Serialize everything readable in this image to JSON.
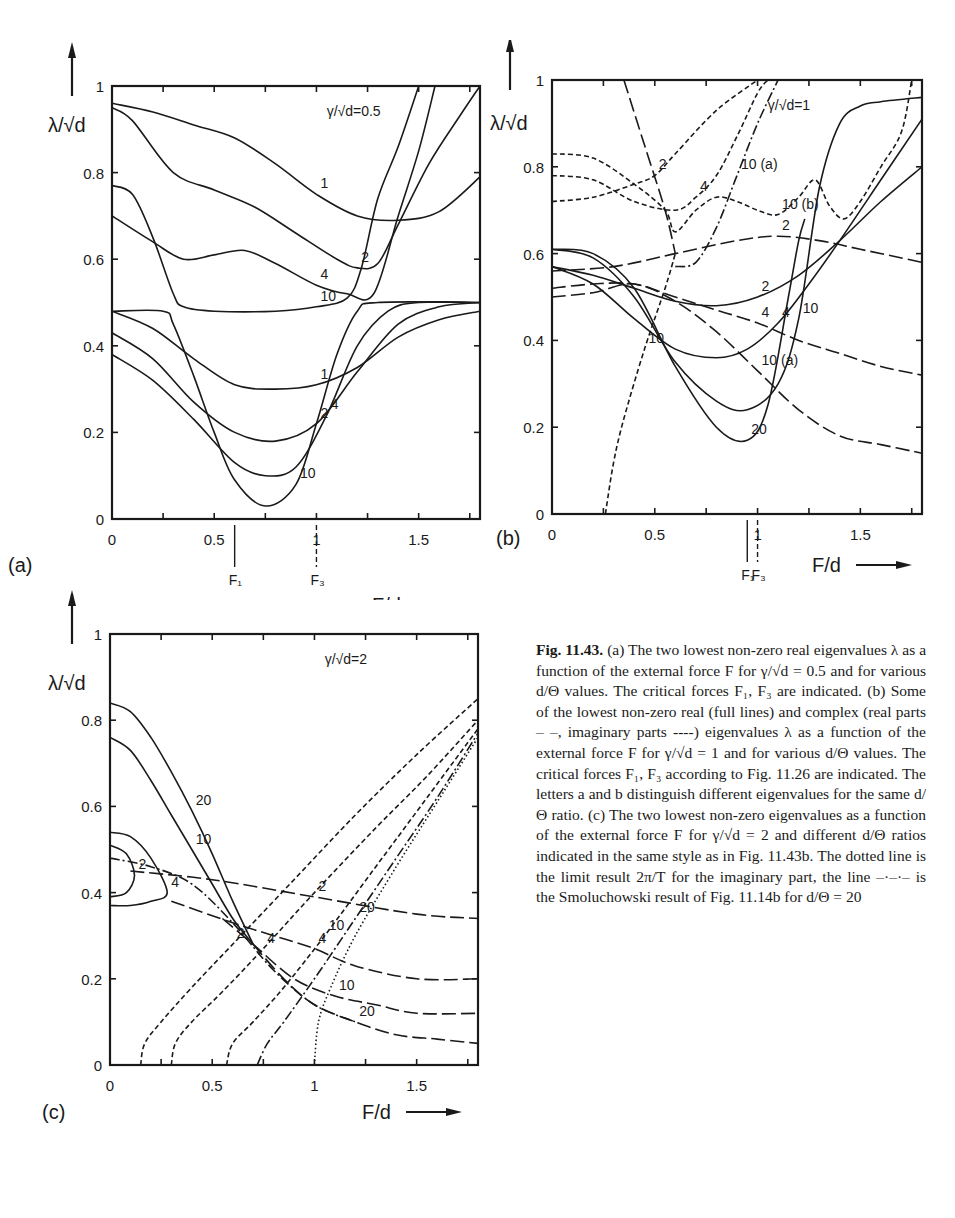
{
  "figure_caption": {
    "label": "Fig. 11.43.",
    "text_a": "(a) The two lowest non-zero real eigenvalues λ as a function of the external force F for γ/√d = 0.5 and for various d/Θ values. The critical forces F₁, F₃ are indicated.",
    "text_b": "(b) Some of the lowest non-zero real (full lines) and complex (real parts – –, imaginary parts ----) eigenvalues λ as a function of the external force F for γ/√d = 1 and for various d/Θ values. The critical forces F₁, F₃ according to Fig. 11.26 are indicated. The letters a and b distinguish different eigenvalues for the same d/Θ ratio.",
    "text_c": "(c) The two lowest non-zero eigenvalues as a function of the external force F for γ/√d = 2 and different d/Θ ratios indicated in the same style as in Fig. 11.43b. The dotted line is the limit result 2π/T for the imaginary part, the line –·–·– is the Smoluchowski result of Fig. 11.14b for d/Θ = 20"
  },
  "chart_data": [
    {
      "type": "line",
      "panel": "(a)",
      "title": "γ/√d=0.5",
      "xlabel": "F/d",
      "ylabel": "λ/√d",
      "xlim": [
        0,
        1.8
      ],
      "ylim": [
        0,
        1
      ],
      "xticks": [
        "0",
        "0.5",
        "1",
        "1.5"
      ],
      "yticks": [
        "0",
        "0.2",
        "0.4",
        "0.6",
        "0.8",
        "1"
      ],
      "markers": [
        {
          "label": "F₁",
          "x": 0.6
        },
        {
          "label": "F₃",
          "x": 1.0
        }
      ],
      "series": [
        {
          "name": "1 (upper)",
          "style": "solid",
          "label": "1",
          "x": [
            0,
            0.2,
            0.4,
            0.6,
            0.8,
            1.0,
            1.2,
            1.4,
            1.6,
            1.8
          ],
          "y": [
            0.96,
            0.94,
            0.91,
            0.88,
            0.82,
            0.75,
            0.7,
            0.69,
            0.71,
            0.79
          ]
        },
        {
          "name": "2 (upper)",
          "style": "solid",
          "label": "2",
          "x": [
            0,
            0.1,
            0.3,
            0.5,
            0.7,
            0.9,
            1.1,
            1.2,
            1.3,
            1.4,
            1.55,
            1.7,
            1.8
          ],
          "y": [
            0.95,
            0.92,
            0.8,
            0.76,
            0.72,
            0.66,
            0.6,
            0.58,
            0.59,
            0.68,
            0.82,
            0.93,
            1.0
          ]
        },
        {
          "name": "4 (upper)",
          "style": "solid",
          "label": "4",
          "x": [
            0,
            0.2,
            0.35,
            0.5,
            0.65,
            0.8,
            1.0,
            1.15,
            1.28,
            1.4,
            1.5,
            1.58
          ],
          "y": [
            0.7,
            0.64,
            0.6,
            0.61,
            0.62,
            0.59,
            0.54,
            0.52,
            0.52,
            0.7,
            0.85,
            1.0
          ]
        },
        {
          "name": "10 (upper)",
          "style": "solid",
          "label": "10",
          "x": [
            0,
            0.1,
            0.2,
            0.3,
            0.35,
            0.5,
            0.8,
            1.0,
            1.15,
            1.22,
            1.3,
            1.4,
            1.5
          ],
          "y": [
            0.77,
            0.75,
            0.65,
            0.52,
            0.49,
            0.48,
            0.48,
            0.49,
            0.51,
            0.58,
            0.74,
            0.86,
            1.0
          ]
        },
        {
          "name": "1 (lower)",
          "style": "solid",
          "label": "1",
          "x": [
            0,
            0.2,
            0.4,
            0.6,
            0.8,
            1.0,
            1.2,
            1.4,
            1.6,
            1.8
          ],
          "y": [
            0.48,
            0.44,
            0.37,
            0.31,
            0.3,
            0.31,
            0.35,
            0.42,
            0.46,
            0.48
          ]
        },
        {
          "name": "2 (lower)",
          "style": "solid",
          "label": "2",
          "x": [
            0,
            0.2,
            0.4,
            0.6,
            0.8,
            1.0,
            1.2,
            1.4,
            1.6,
            1.8
          ],
          "y": [
            0.43,
            0.37,
            0.27,
            0.2,
            0.18,
            0.22,
            0.34,
            0.45,
            0.49,
            0.5
          ]
        },
        {
          "name": "4 (lower)",
          "style": "solid",
          "label": "4",
          "x": [
            0,
            0.2,
            0.4,
            0.6,
            0.75,
            0.9,
            1.05,
            1.2,
            1.35,
            1.5,
            1.8
          ],
          "y": [
            0.38,
            0.32,
            0.23,
            0.13,
            0.1,
            0.12,
            0.24,
            0.4,
            0.48,
            0.5,
            0.5
          ]
        },
        {
          "name": "10 (lower)",
          "style": "solid",
          "label": "10",
          "x": [
            0,
            0.25,
            0.3,
            0.4,
            0.5,
            0.6,
            0.75,
            0.9,
            1.0,
            1.1,
            1.2,
            1.3,
            1.8
          ],
          "y": [
            0.48,
            0.48,
            0.45,
            0.33,
            0.2,
            0.09,
            0.03,
            0.08,
            0.22,
            0.38,
            0.48,
            0.5,
            0.5
          ]
        }
      ]
    },
    {
      "type": "line",
      "panel": "(b)",
      "title": "γ/√d=1",
      "xlabel": "F/d",
      "ylabel": "λ/√d",
      "xlim": [
        0,
        1.8
      ],
      "ylim": [
        0,
        1
      ],
      "xticks": [
        "0",
        "0.5",
        "1",
        "1.5"
      ],
      "yticks": [
        "0",
        "0.2",
        "0.4",
        "0.6",
        "0.8",
        "1"
      ],
      "markers": [
        {
          "label": "F₁",
          "x": 0.95
        },
        {
          "label": "F₃",
          "x": 1.0
        }
      ],
      "series": [
        {
          "name": "2 real",
          "style": "solid",
          "label": "2",
          "x": [
            0,
            0.2,
            0.4,
            0.6,
            0.8,
            1.0,
            1.2,
            1.4,
            1.6,
            1.8
          ],
          "y": [
            0.57,
            0.55,
            0.52,
            0.49,
            0.48,
            0.5,
            0.55,
            0.63,
            0.72,
            0.8
          ]
        },
        {
          "name": "4 real",
          "style": "solid",
          "label": "4",
          "x": [
            0,
            0.2,
            0.4,
            0.6,
            0.8,
            0.95,
            1.1,
            1.25,
            1.4,
            1.6,
            1.8
          ],
          "y": [
            0.57,
            0.53,
            0.45,
            0.38,
            0.36,
            0.38,
            0.44,
            0.53,
            0.63,
            0.77,
            0.91
          ]
        },
        {
          "name": "10 real",
          "style": "solid",
          "label": "10",
          "x": [
            0,
            0.2,
            0.4,
            0.6,
            0.8,
            0.95,
            1.1,
            1.2,
            1.3,
            1.4,
            1.5,
            1.6,
            1.8
          ],
          "y": [
            0.61,
            0.59,
            0.5,
            0.35,
            0.26,
            0.24,
            0.3,
            0.45,
            0.75,
            0.9,
            0.94,
            0.95,
            0.96
          ]
        },
        {
          "name": "20 real",
          "style": "solid",
          "label": "20",
          "x": [
            0,
            0.2,
            0.4,
            0.6,
            0.8,
            0.95,
            1.05,
            1.15,
            1.2,
            1.23
          ],
          "y": [
            0.61,
            0.6,
            0.52,
            0.34,
            0.2,
            0.17,
            0.25,
            0.5,
            0.63,
            0.68
          ]
        },
        {
          "name": "2 real part",
          "style": "dashed",
          "label": "2",
          "x": [
            0,
            0.3,
            0.6,
            0.9,
            1.1,
            1.3,
            1.5,
            1.8
          ],
          "y": [
            0.56,
            0.57,
            0.6,
            0.63,
            0.64,
            0.63,
            0.61,
            0.58
          ]
        },
        {
          "name": "4 real part",
          "style": "dashed",
          "label": "4",
          "x": [
            0,
            0.2,
            0.4,
            0.6,
            0.8,
            1.0,
            1.2,
            1.4,
            1.6,
            1.8
          ],
          "y": [
            0.52,
            0.53,
            0.53,
            0.5,
            0.47,
            0.44,
            0.4,
            0.37,
            0.34,
            0.32
          ]
        },
        {
          "name": "10 real part (a)",
          "style": "dashed",
          "label": "10 (a)",
          "x": [
            0,
            0.2,
            0.4,
            0.6,
            0.8,
            1.0,
            1.2,
            1.4,
            1.6,
            1.8
          ],
          "y": [
            0.5,
            0.51,
            0.53,
            0.49,
            0.42,
            0.33,
            0.24,
            0.18,
            0.16,
            0.14
          ]
        },
        {
          "name": "10 real part (steep)",
          "style": "dashed",
          "label": "",
          "x": [
            0.35,
            0.45,
            0.55,
            0.6
          ],
          "y": [
            1.0,
            0.85,
            0.7,
            0.6
          ]
        },
        {
          "name": "2 imaginary part",
          "style": "short-dashed",
          "label": "2",
          "x": [
            0,
            0.2,
            0.4,
            0.5,
            0.6,
            0.8,
            1.0
          ],
          "y": [
            0.72,
            0.73,
            0.76,
            0.78,
            0.83,
            0.93,
            1.0
          ]
        },
        {
          "name": "4 imaginary part",
          "style": "short-dashed",
          "label": "4",
          "x": [
            0,
            0.2,
            0.4,
            0.6,
            0.7,
            0.8,
            0.9,
            1.0,
            1.05
          ],
          "y": [
            0.78,
            0.77,
            0.72,
            0.7,
            0.73,
            0.78,
            0.87,
            0.97,
            1.0
          ]
        },
        {
          "name": "10 imaginary part (b)",
          "style": "short-dashed",
          "label": "10 (b)",
          "x": [
            0,
            0.2,
            0.4,
            0.55,
            0.6,
            0.7,
            0.8,
            0.9,
            1.0,
            1.1,
            1.2,
            1.28,
            1.35,
            1.42,
            1.5,
            1.6,
            1.7,
            1.75
          ],
          "y": [
            0.83,
            0.82,
            0.76,
            0.7,
            0.65,
            0.7,
            0.73,
            0.72,
            0.7,
            0.69,
            0.73,
            0.77,
            0.71,
            0.68,
            0.72,
            0.8,
            0.88,
            1.0
          ]
        },
        {
          "name": "10 imaginary part (a)",
          "style": "dash-dot",
          "label": "10 (a)",
          "x": [
            0.6,
            0.7,
            0.8,
            0.9,
            1.0,
            1.1
          ],
          "y": [
            0.57,
            0.58,
            0.66,
            0.78,
            0.9,
            1.0
          ]
        },
        {
          "name": "10 imaginary part (rising)",
          "style": "short-dashed",
          "label": "10",
          "x": [
            0.26,
            0.3,
            0.35,
            0.45,
            0.55,
            0.6
          ],
          "y": [
            0.0,
            0.12,
            0.22,
            0.38,
            0.52,
            0.6
          ]
        }
      ]
    },
    {
      "type": "line",
      "panel": "(c)",
      "title": "γ/√d=2",
      "xlabel": "F/d",
      "ylabel": "λ/√d",
      "xlim": [
        0,
        1.8
      ],
      "ylim": [
        0,
        1
      ],
      "xticks": [
        "0",
        "0.5",
        "1",
        "1.5"
      ],
      "yticks": [
        "0",
        "0.2",
        "0.4",
        "0.6",
        "0.8",
        "1"
      ],
      "series": [
        {
          "name": "20 real",
          "style": "solid",
          "label": "20",
          "x": [
            0,
            0.1,
            0.2,
            0.3,
            0.4,
            0.5,
            0.6,
            0.7
          ],
          "y": [
            0.84,
            0.82,
            0.76,
            0.68,
            0.59,
            0.49,
            0.38,
            0.28
          ]
        },
        {
          "name": "10 real",
          "style": "solid",
          "label": "10",
          "x": [
            0,
            0.1,
            0.2,
            0.3,
            0.4,
            0.5,
            0.6,
            0.7
          ],
          "y": [
            0.76,
            0.73,
            0.66,
            0.58,
            0.5,
            0.42,
            0.34,
            0.28
          ]
        },
        {
          "name": "4 real (loop)",
          "style": "solid",
          "label": "4",
          "x": [
            0,
            0.1,
            0.2,
            0.28,
            0.2,
            0.1,
            0
          ],
          "y": [
            0.54,
            0.53,
            0.48,
            0.4,
            0.38,
            0.37,
            0.37
          ]
        },
        {
          "name": "2 real (loop)",
          "style": "solid",
          "label": "2",
          "x": [
            0,
            0.08,
            0.12,
            0.08,
            0
          ],
          "y": [
            0.51,
            0.49,
            0.44,
            0.4,
            0.39
          ]
        },
        {
          "name": "2 real part",
          "style": "dashed",
          "label": "2",
          "x": [
            0.1,
            0.5,
            1.0,
            1.5,
            1.8
          ],
          "y": [
            0.45,
            0.43,
            0.39,
            0.35,
            0.34
          ]
        },
        {
          "name": "4 real part",
          "style": "dashed",
          "label": "4",
          "x": [
            0.3,
            0.6,
            0.8,
            1.0,
            1.2,
            1.5,
            1.8
          ],
          "y": [
            0.38,
            0.33,
            0.3,
            0.27,
            0.23,
            0.2,
            0.2
          ]
        },
        {
          "name": "10 real part",
          "style": "dashed",
          "label": "10",
          "x": [
            0.55,
            0.7,
            0.9,
            1.1,
            1.3,
            1.5,
            1.8
          ],
          "y": [
            0.34,
            0.28,
            0.2,
            0.16,
            0.14,
            0.12,
            0.12
          ]
        },
        {
          "name": "20 real part",
          "style": "dashed",
          "label": "20",
          "x": [
            0.7,
            0.85,
            1.0,
            1.2,
            1.4,
            1.6,
            1.8
          ],
          "y": [
            0.28,
            0.2,
            0.14,
            0.1,
            0.07,
            0.06,
            0.05
          ]
        },
        {
          "name": "Smoluchowski d/Θ=20",
          "style": "dash-dot",
          "label": "",
          "x": [
            0,
            0.2,
            0.4,
            0.6,
            0.8,
            1.0,
            1.2
          ],
          "y": [
            0.48,
            0.46,
            0.42,
            0.33,
            0.22,
            0.14,
            0.1
          ]
        },
        {
          "name": "2 imaginary part",
          "style": "short-dashed",
          "label": "2",
          "x": [
            0.15,
            0.17,
            0.25,
            0.4,
            0.6,
            0.9,
            1.2,
            1.5,
            1.8
          ],
          "y": [
            0.0,
            0.05,
            0.1,
            0.18,
            0.28,
            0.43,
            0.58,
            0.72,
            0.85
          ]
        },
        {
          "name": "4 imaginary part",
          "style": "short-dashed",
          "label": "4",
          "x": [
            0.3,
            0.32,
            0.4,
            0.55,
            0.75,
            1.0,
            1.3,
            1.55,
            1.8
          ],
          "y": [
            0.0,
            0.05,
            0.1,
            0.17,
            0.27,
            0.4,
            0.55,
            0.67,
            0.8
          ]
        },
        {
          "name": "10 imaginary part",
          "style": "short-dashed",
          "label": "10",
          "x": [
            0.57,
            0.6,
            0.7,
            0.85,
            1.05,
            1.3,
            1.55,
            1.8
          ],
          "y": [
            0.0,
            0.05,
            0.1,
            0.18,
            0.3,
            0.46,
            0.62,
            0.78
          ]
        },
        {
          "name": "20 imaginary part",
          "style": "dash-dot",
          "label": "20",
          "x": [
            0.72,
            0.77,
            0.85,
            1.0,
            1.2,
            1.4,
            1.6,
            1.8
          ],
          "y": [
            0.0,
            0.05,
            0.1,
            0.2,
            0.34,
            0.48,
            0.62,
            0.77
          ]
        },
        {
          "name": "2π/T limit",
          "style": "dotted",
          "label": "",
          "x": [
            1.0,
            1.02,
            1.08,
            1.2,
            1.4,
            1.6,
            1.8
          ],
          "y": [
            0.0,
            0.1,
            0.18,
            0.3,
            0.46,
            0.61,
            0.76
          ]
        }
      ]
    }
  ]
}
